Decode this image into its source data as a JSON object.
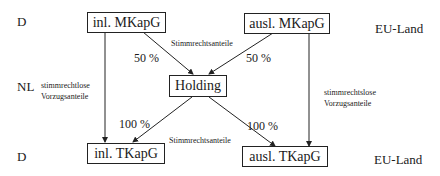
{
  "countries": {
    "top_left": "D",
    "top_right": "EU-Land",
    "middle_left": "NL",
    "bottom_left": "D",
    "bottom_right": "EU-Land"
  },
  "nodes": {
    "inl_mkapg": "inl. MKapG",
    "ausl_mkapg": "ausl. MKapG",
    "holding": "Holding",
    "inl_tkapg": "inl. TKapG",
    "ausl_tkapg": "ausl. TKapG"
  },
  "edges": {
    "inl_mkapg_to_holding": "50 %",
    "ausl_mkapg_to_holding": "50 %",
    "holding_to_inl_tkapg": "100 %",
    "holding_to_ausl_tkapg": "100 %"
  },
  "annotations": {
    "stimmrechtsanteile_top": "Stimmrechtsanteile",
    "stimmrechtsanteile_bottom": "Stimmrechtsanteile",
    "left_nonvoting_line1": "stimmrechtlose",
    "left_nonvoting_line2": "Vorzugsanteile",
    "right_nonvoting_line1": "stimmrechtslose",
    "right_nonvoting_line2": "Vorzugsanteile"
  }
}
